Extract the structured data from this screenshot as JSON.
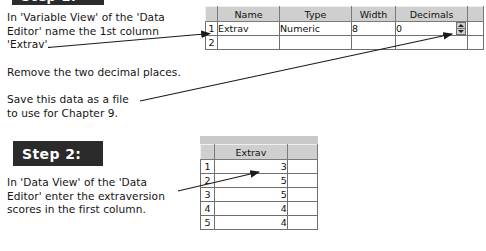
{
  "steps": {
    "step1_label": "Step 1:",
    "step2_label": "Step 2:"
  },
  "instructions": {
    "step1_text": "In 'Variable View' of the 'Data\nEditor' name the 1st column\n'Extrav'.",
    "remove_decimals_text": "Remove the two decimal places.",
    "save_text": "Save this data as a file\nto use for Chapter 9.",
    "step2_text": "In 'Data View' of the 'Data\nEditor' enter the extraversion\nscores in the first column."
  },
  "variable_view": {
    "columns": [
      "Name",
      "Type",
      "Width",
      "Decimals"
    ],
    "rows": [
      {
        "number": "1",
        "name": "Extrav",
        "type": "Numeric",
        "width": "8",
        "decimals": "0"
      },
      {
        "number": "2",
        "name": "",
        "type": "",
        "width": "",
        "decimals": ""
      }
    ],
    "spinner": {
      "up_icon": "triangle-up-icon",
      "down_icon": "triangle-down-icon"
    }
  },
  "data_view": {
    "column_header": "Extrav",
    "rows": [
      {
        "number": "1",
        "value": "3"
      },
      {
        "number": "2",
        "value": "5"
      },
      {
        "number": "3",
        "value": "5"
      },
      {
        "number": "4",
        "value": "4"
      },
      {
        "number": "5",
        "value": "4"
      }
    ]
  },
  "annotations": {
    "arrow1_name": "arrow-to-name-cell",
    "arrow2_name": "arrow-to-decimals-cell",
    "arrow3_name": "arrow-to-first-data-cell"
  },
  "colors": {
    "badge_background": "#2b2b2b",
    "badge_text": "#ffffff",
    "header_background": "#cfcfcf",
    "rownum_background": "#c4c4c4",
    "grid_line": "#6f6f6f",
    "text": "#141414"
  }
}
